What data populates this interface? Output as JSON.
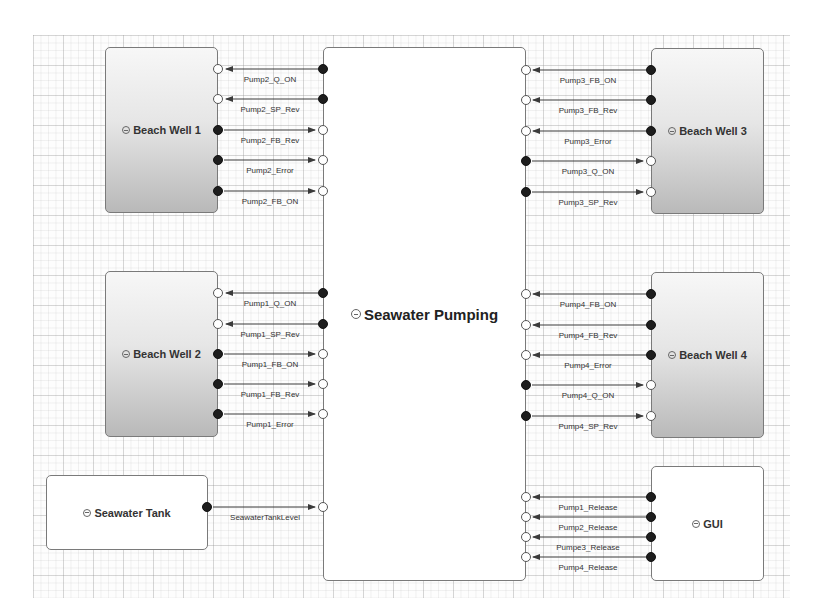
{
  "diagram": {
    "blocks": {
      "center": {
        "label": "Seawater Pumping"
      },
      "bw1": {
        "label": "Beach Well 1"
      },
      "bw2": {
        "label": "Beach Well 2"
      },
      "bw3": {
        "label": "Beach Well 3"
      },
      "bw4": {
        "label": "Beach Well 4"
      },
      "tank": {
        "label": "Seawater Tank"
      },
      "gui": {
        "label": "GUI"
      }
    },
    "connections": {
      "bw1": [
        {
          "label": "Pump2_Q_ON",
          "direction": "center_to_block"
        },
        {
          "label": "Pump2_SP_Rev",
          "direction": "center_to_block"
        },
        {
          "label": "Pump2_FB_Rev",
          "direction": "block_to_center"
        },
        {
          "label": "Pump2_Error",
          "direction": "block_to_center"
        },
        {
          "label": "Pump2_FB_ON",
          "direction": "block_to_center"
        }
      ],
      "bw2": [
        {
          "label": "Pump1_Q_ON",
          "direction": "center_to_block"
        },
        {
          "label": "Pump1_SP_Rev",
          "direction": "center_to_block"
        },
        {
          "label": "Pump1_FB_ON",
          "direction": "block_to_center"
        },
        {
          "label": "Pump1_FB_Rev",
          "direction": "block_to_center"
        },
        {
          "label": "Pump1_Error",
          "direction": "block_to_center"
        }
      ],
      "bw3": [
        {
          "label": "Pump3_FB_ON",
          "direction": "block_to_center"
        },
        {
          "label": "Pump3_FB_Rev",
          "direction": "block_to_center"
        },
        {
          "label": "Pump3_Error",
          "direction": "block_to_center"
        },
        {
          "label": "Pump3_Q_ON",
          "direction": "center_to_block"
        },
        {
          "label": "Pump3_SP_Rev",
          "direction": "center_to_block"
        }
      ],
      "bw4": [
        {
          "label": "Pump4_FB_ON",
          "direction": "block_to_center"
        },
        {
          "label": "Pump4_FB_Rev",
          "direction": "block_to_center"
        },
        {
          "label": "Pump4_Error",
          "direction": "block_to_center"
        },
        {
          "label": "Pump4_Q_ON",
          "direction": "center_to_block"
        },
        {
          "label": "Pump4_SP_Rev",
          "direction": "center_to_block"
        }
      ],
      "tank": [
        {
          "label": "SeawaterTankLevel",
          "direction": "block_to_center"
        }
      ],
      "gui": [
        {
          "label": "Pump1_Release",
          "direction": "block_to_center"
        },
        {
          "label": "Pump2_Release",
          "direction": "block_to_center"
        },
        {
          "label": "Pumpe3_Release",
          "direction": "block_to_center"
        },
        {
          "label": "Pump4_Release",
          "direction": "block_to_center"
        }
      ]
    },
    "icons": {
      "block_icon": "component-circle-icon"
    },
    "colors": {
      "wire": "#3a3a3a",
      "block_border": "#7a7a7a",
      "gradient_bottom": "#b9b9b9"
    }
  }
}
